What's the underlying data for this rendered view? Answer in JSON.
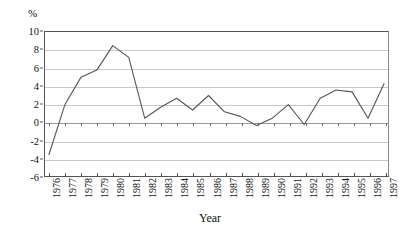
{
  "chart_data": {
    "type": "line",
    "title": "",
    "subtitle": "",
    "xlabel": "Year",
    "ylabel": "%",
    "y_unit_label": "%",
    "categories": [
      "1976",
      "1977",
      "1978",
      "1979",
      "1980",
      "1981",
      "1982",
      "1983",
      "1984",
      "1985",
      "1986",
      "1987",
      "1988",
      "1989",
      "1990",
      "1991",
      "1992",
      "1993",
      "1994",
      "1995",
      "1996",
      "1997"
    ],
    "values": [
      -3.5,
      2.0,
      5.0,
      5.8,
      8.5,
      7.2,
      0.5,
      1.7,
      2.7,
      1.4,
      3.0,
      1.2,
      0.7,
      -0.3,
      0.5,
      2.0,
      -0.2,
      2.7,
      3.6,
      3.4,
      0.5,
      4.3
    ],
    "series": [
      {
        "name": "",
        "values": [
          -3.5,
          2.0,
          5.0,
          5.8,
          8.5,
          7.2,
          0.5,
          1.7,
          2.7,
          1.4,
          3.0,
          1.2,
          0.7,
          -0.3,
          0.5,
          2.0,
          -0.2,
          2.7,
          3.6,
          3.4,
          0.5,
          4.3
        ],
        "color": "#555555"
      }
    ],
    "ylim": [
      -6,
      10
    ],
    "ytick_values": [
      10,
      8,
      6,
      4,
      2,
      0,
      -2,
      -4,
      -6
    ],
    "ytick_labels": [
      "10",
      "8",
      "6",
      "4",
      "2",
      "0",
      "-2",
      "-4",
      "-6"
    ],
    "grid": true,
    "grid_color": "#c9c9c9",
    "zero_line_color": "#9a9a9a",
    "legend": "none",
    "legend_position": "none",
    "annotations": []
  }
}
